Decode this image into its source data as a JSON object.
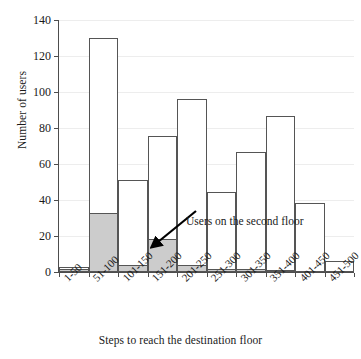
{
  "chart_data": {
    "type": "bar",
    "title": "",
    "xlabel": "Steps to reach the destination floor",
    "ylabel": "Number of users",
    "categories": [
      "1-50",
      "51-100",
      "101-150",
      "151-200",
      "201-250",
      "251-300",
      "301-350",
      "351-400",
      "401-450",
      "451-500"
    ],
    "ylim": [
      0,
      140
    ],
    "yticks": [
      0,
      20,
      40,
      60,
      80,
      100,
      120,
      140
    ],
    "grid": true,
    "legend_position": "none",
    "series": [
      {
        "name": "Total users",
        "values": [
          3,
          130,
          51,
          75.5,
          96,
          44.5,
          66.5,
          86.5,
          38.5,
          6
        ]
      },
      {
        "name": "Users on the second floor",
        "values": [
          1.5,
          33,
          4,
          18.5,
          4,
          1.5,
          1.5,
          1,
          0,
          0
        ]
      }
    ],
    "annotations": [
      {
        "text": "Users on the second floor",
        "target_category": "151-200"
      }
    ],
    "colors": {
      "bar_fill": "#ffffff",
      "bar_stroke": "#555555",
      "second_floor_fill": "#cccccc",
      "axis": "#4d4d4d",
      "grid": "#ededed",
      "text": "#1a1a1a"
    }
  }
}
